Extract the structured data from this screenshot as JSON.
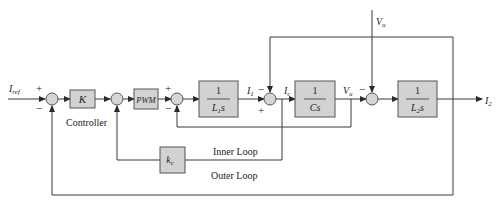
{
  "diagram": {
    "type": "block-diagram",
    "colors": {
      "block_fill": "#d2d2d2",
      "line": "#3a3a3a",
      "background": "#ffffff"
    },
    "inputs": {
      "reference": {
        "symbol": "I",
        "subscript": "ref"
      },
      "disturbance": {
        "symbol": "V",
        "subscript": "u"
      }
    },
    "output": {
      "symbol": "I",
      "subscript": "2"
    },
    "blocks": {
      "controller": {
        "label": "K"
      },
      "pwm": {
        "label": "PWM"
      },
      "inductor1": {
        "numerator": "1",
        "denominator": "L",
        "den_sub": "1",
        "den_tail": "s"
      },
      "capacitor": {
        "numerator": "1",
        "denominator": "Cs"
      },
      "inductor2": {
        "numerator": "1",
        "denominator": "L",
        "den_sub": "2",
        "den_tail": "s"
      },
      "inner_gain": {
        "symbol": "k",
        "subscript": "c"
      }
    },
    "signals": {
      "i1": {
        "symbol": "I",
        "subscript": "1"
      },
      "ic": {
        "symbol": "I",
        "subscript": "c"
      },
      "vu": {
        "symbol": "V",
        "subscript": "u"
      }
    },
    "signs": {
      "sum1_plus": "+",
      "sum1_minus": "−",
      "sum3_plus": "+",
      "sum3_minus": "−",
      "sum4_minus": "−",
      "sum4_plus": "+",
      "sum5_minus": "−"
    },
    "annotations": {
      "controller": "Controller",
      "inner_loop": "Inner Loop",
      "outer_loop": "Outer Loop"
    }
  }
}
